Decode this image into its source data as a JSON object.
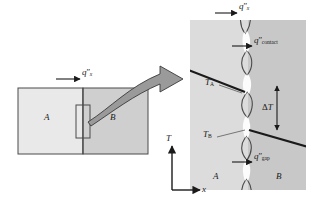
{
  "figure": {
    "name": "thermal-contact-resistance-diagram"
  },
  "colors": {
    "material_a_fill": "#e9e9e9",
    "material_b_fill": "#cfcfcf",
    "panel_a_fill": "#dcdcdc",
    "panel_b_fill": "#c8c8c8",
    "outline": "#4a4a4a",
    "ink": "#1a1a1a",
    "arrow_fill": "#9a9a9a",
    "arrow_stroke": "#3a3a3a"
  },
  "left_diagram": {
    "name": "composite-wall",
    "material_a_label": "A",
    "material_b_label": "B",
    "heat_flux_label": {
      "q": "q",
      "primes": "″",
      "sub": "x"
    },
    "callout_box_label": "magnified-interface-region"
  },
  "right_panel": {
    "name": "magnified-interface",
    "material_a_label": "A",
    "material_b_label": "B",
    "top_flux_label": {
      "q": "q",
      "primes": "″",
      "sub": "x"
    },
    "contact_flux_label": {
      "q": "q",
      "primes": "″",
      "sub": "contact"
    },
    "gap_flux_label": {
      "q": "q",
      "primes": "″",
      "sub": "gap"
    },
    "temp_a_label": {
      "t": "T",
      "sub": "A"
    },
    "temp_b_label": {
      "t": "T",
      "sub": "B"
    },
    "delta_t_label": {
      "delta": "Δ",
      "t": "T"
    }
  },
  "axes": {
    "vertical_label": "T",
    "horizontal_label": "x"
  }
}
